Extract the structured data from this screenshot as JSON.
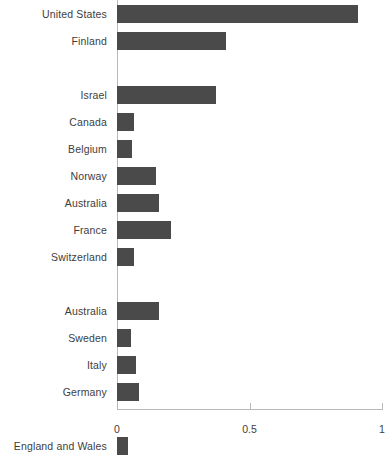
{
  "chart_data": {
    "type": "bar",
    "orientation": "horizontal",
    "title": "",
    "subtitle": "",
    "xlabel": "",
    "ylabel": "",
    "xlim": [
      0,
      1
    ],
    "grid": false,
    "legend": null,
    "bar_color": "#4a4a4a",
    "axis_color": "#b9b9b9",
    "text_color": "#3d3d3d",
    "xticks": [
      {
        "value": 0,
        "label": "0"
      },
      {
        "value": 0.5,
        "label": "0.5"
      },
      {
        "value": 1,
        "label": "1"
      }
    ],
    "categories": [
      "United States",
      "Finland",
      "Israel",
      "Canada",
      "Belgium",
      "Norway",
      "Australia",
      "France",
      "Switzerland",
      "Australia",
      "Sweden",
      "Italy",
      "Germany",
      "England and Wales"
    ],
    "values": [
      0.91,
      0.41,
      0.375,
      0.065,
      0.057,
      0.148,
      0.16,
      0.205,
      0.065,
      0.16,
      0.053,
      0.072,
      0.083,
      0.042
    ],
    "rows": [
      {
        "label": "United States",
        "value": 0.91,
        "slot": 0
      },
      {
        "label": "Finland",
        "value": 0.41,
        "slot": 1
      },
      {
        "label": "Israel",
        "value": 0.375,
        "slot": 3
      },
      {
        "label": "Canada",
        "value": 0.065,
        "slot": 4
      },
      {
        "label": "Belgium",
        "value": 0.057,
        "slot": 5
      },
      {
        "label": "Norway",
        "value": 0.148,
        "slot": 6
      },
      {
        "label": "Australia",
        "value": 0.16,
        "slot": 7
      },
      {
        "label": "France",
        "value": 0.205,
        "slot": 8
      },
      {
        "label": "Switzerland",
        "value": 0.065,
        "slot": 9
      },
      {
        "label": "Australia",
        "value": 0.16,
        "slot": 11
      },
      {
        "label": "Sweden",
        "value": 0.053,
        "slot": 12
      },
      {
        "label": "Italy",
        "value": 0.072,
        "slot": 13
      },
      {
        "label": "Germany",
        "value": 0.083,
        "slot": 14
      },
      {
        "label": "England and Wales",
        "value": 0.042,
        "slot": 16
      }
    ]
  }
}
